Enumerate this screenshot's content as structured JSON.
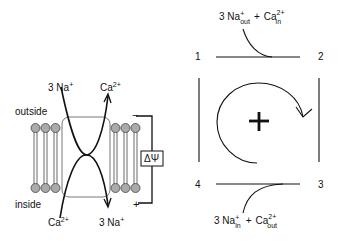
{
  "membrane": {
    "outside_label": "outside",
    "inside_label": "inside",
    "top_left_ion": "3 Na",
    "top_left_sup": "+",
    "top_right_ion": "Ca",
    "top_right_sup": "2+",
    "bottom_left_ion": "Ca",
    "bottom_left_sup": "2+",
    "bottom_right_ion": "3 Na",
    "bottom_right_sup": "+",
    "potential_label": "ΔΨ",
    "minus_sign": "−",
    "plus_sign": "+"
  },
  "cycle": {
    "corner_1": "1",
    "corner_2": "2",
    "corner_3": "3",
    "corner_4": "4",
    "center_sign": "+",
    "top_reaction": {
      "na": "3 Na",
      "na_sup": "+",
      "na_sub": "out",
      "plus": "+",
      "ca": "Ca",
      "ca_sup": "2+",
      "ca_sub": "in"
    },
    "bottom_reaction": {
      "na": "3 Na",
      "na_sup": "+",
      "na_sub": "in",
      "plus": "+",
      "ca": "Ca",
      "ca_sup": "2+",
      "ca_sub": "out"
    }
  }
}
